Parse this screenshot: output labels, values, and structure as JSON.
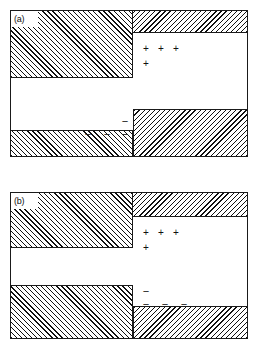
{
  "figure": {
    "caption_absent": true,
    "background_color": "#ffffff",
    "line_color": "#1a1a1a",
    "hatch_color": "#101010"
  },
  "panels": [
    {
      "id": "a",
      "label": "(a)",
      "regions": [
        {
          "name": "upper-left-hatched",
          "hatch": "forward",
          "x": 0,
          "y": 0,
          "w": 122,
          "h": 67
        },
        {
          "name": "upper-right-hatched",
          "hatch": "backward",
          "x": 122,
          "y": 0,
          "w": 114,
          "h": 22
        },
        {
          "name": "lower-left-hatched",
          "hatch": "forward",
          "x": 0,
          "y": 119,
          "w": 122,
          "h": 26
        },
        {
          "name": "lower-right-hatched",
          "hatch": "backward",
          "x": 122,
          "y": 98,
          "w": 114,
          "h": 47
        }
      ],
      "positive_signs": [
        {
          "symbol": "+",
          "x": 131,
          "y": 34
        },
        {
          "symbol": "+",
          "x": 146,
          "y": 34
        },
        {
          "symbol": "+",
          "x": 161,
          "y": 34
        },
        {
          "symbol": "+",
          "x": 131,
          "y": 49
        }
      ],
      "negative_signs": [
        {
          "symbol": "−",
          "x": 110,
          "y": 106
        },
        {
          "symbol": "−",
          "x": 73,
          "y": 119
        },
        {
          "symbol": "−",
          "x": 92,
          "y": 119
        },
        {
          "symbol": "−",
          "x": 110,
          "y": 119
        }
      ]
    },
    {
      "id": "b",
      "label": "(b)",
      "regions": [
        {
          "name": "upper-left-hatched",
          "hatch": "forward",
          "x": 0,
          "y": 0,
          "w": 122,
          "h": 55
        },
        {
          "name": "upper-right-hatched",
          "hatch": "backward",
          "x": 122,
          "y": 0,
          "w": 114,
          "h": 24
        },
        {
          "name": "lower-left-hatched",
          "hatch": "forward",
          "x": 0,
          "y": 92,
          "w": 122,
          "h": 53
        },
        {
          "name": "lower-right-hatched",
          "hatch": "backward",
          "x": 122,
          "y": 113,
          "w": 114,
          "h": 32
        }
      ],
      "positive_signs": [
        {
          "symbol": "+",
          "x": 131,
          "y": 36
        },
        {
          "symbol": "+",
          "x": 146,
          "y": 36
        },
        {
          "symbol": "+",
          "x": 161,
          "y": 36
        },
        {
          "symbol": "+",
          "x": 131,
          "y": 51
        }
      ],
      "negative_signs": [
        {
          "symbol": "−",
          "x": 131,
          "y": 94
        },
        {
          "symbol": "−",
          "x": 131,
          "y": 107
        },
        {
          "symbol": "−",
          "x": 150,
          "y": 107
        },
        {
          "symbol": "−",
          "x": 169,
          "y": 107
        }
      ]
    }
  ]
}
